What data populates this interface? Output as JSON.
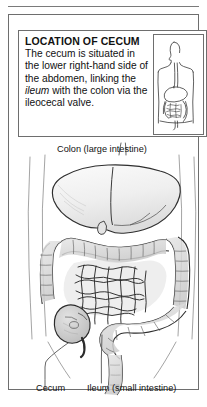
{
  "panel": {
    "caption": {
      "title": "LOCATION OF CECUM",
      "body_before_italic": "The cecum is situated in the lower right-hand side of the abdomen, linking the ",
      "italic_term": "ileum",
      "body_after_italic": " with the colon via the ileocecal valve.",
      "full_text": "The cecum is situated in the lower right-hand side of the abdomen, linking the ileum with the colon via the ileocecal valve."
    },
    "inset": {
      "name": "human-torso-digestive-tract-inset",
      "description": "Outline of human head and torso showing esophagus, stomach and intestines"
    }
  },
  "figure": {
    "name": "abdominal-anatomy-illustration",
    "labels": {
      "colon": "Colon (large intestine)",
      "cecum": "Cecum",
      "ileum": "Ileum (small intestine)"
    },
    "structures": [
      "liver",
      "stomach",
      "transverse colon",
      "ascending colon",
      "descending colon",
      "sigmoid colon",
      "small intestine",
      "cecum",
      "appendix"
    ]
  },
  "colors": {
    "ink": "#111111",
    "border": "#6e6e6e",
    "organ_fill": "#d8d8d8",
    "organ_fill_light": "#ececec",
    "background": "#ffffff"
  }
}
